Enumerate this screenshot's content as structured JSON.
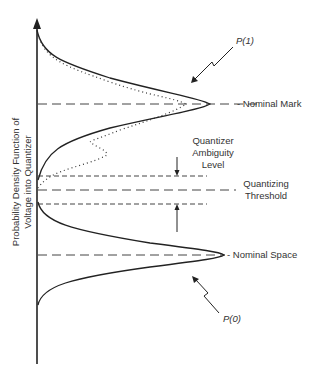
{
  "diagram": {
    "y_axis_label_line1": "Probability Density Function of",
    "y_axis_label_line2": "Voltage into Quantizer",
    "labels": {
      "p1": "P(1)",
      "p0": "P(0)",
      "nominal_mark": "- Nominal Mark",
      "nominal_space": "- Nominal Space",
      "ambiguity_line1": "Quantizer",
      "ambiguity_line2": "Ambiguity",
      "ambiguity_line3": "Level",
      "threshold_line1": "Quantizing",
      "threshold_line2": "Threshold"
    },
    "colors": {
      "line": "#222222",
      "dashed": "#444444",
      "text": "#333333"
    }
  }
}
